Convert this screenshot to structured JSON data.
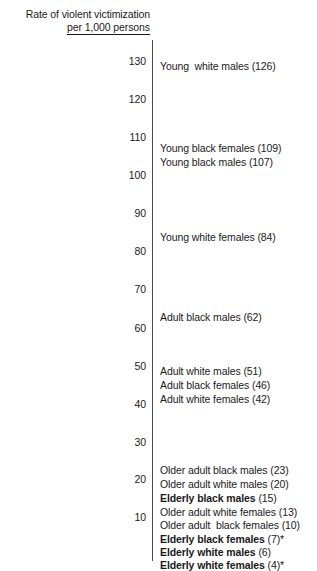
{
  "chart_data": {
    "type": "bar",
    "title": "Rate of violent victimization per 1,000 persons",
    "title_line1": "Rate of violent victimization",
    "title_line2": "per 1,000 persons",
    "xlabel": "",
    "ylabel": "Rate of violent victimization per 1,000 persons",
    "ylim": [
      0,
      135
    ],
    "grid": false,
    "legend": "none",
    "axis": "vertical-scale-with-annotations",
    "tick_labels": [
      "130",
      "120",
      "110",
      "100",
      "90",
      "80",
      "70",
      "60",
      "50",
      "40",
      "30",
      "20",
      "10"
    ],
    "ticks": [
      130,
      120,
      110,
      100,
      90,
      80,
      70,
      60,
      50,
      40,
      30,
      20,
      10
    ],
    "categories": [
      "Young  white males",
      "Young black females",
      "Young black males",
      "Young white females",
      "Adult black males",
      "Adult white males",
      "Adult black females",
      "Adult white females",
      "Older adult black males",
      "Older adult white males",
      "Elderly black males",
      "Older adult white females",
      "Older adult  black females",
      "Elderly black females",
      "Elderly white males",
      "Elderly white females"
    ],
    "values": [
      126,
      109,
      107,
      84,
      62,
      51,
      46,
      42,
      23,
      20,
      15,
      13,
      10,
      7,
      6,
      4
    ],
    "annotations": [
      {
        "name": "Young  white males",
        "value": "(126)",
        "bold": false,
        "y": 60
      },
      {
        "name": "Young black females",
        "value": "(109)",
        "bold": false,
        "y": 142
      },
      {
        "name": "Young black males",
        "value": "(107)",
        "bold": false,
        "y": 156
      },
      {
        "name": "Young white females",
        "value": "(84)",
        "bold": false,
        "y": 231
      },
      {
        "name": "Adult black males",
        "value": "(62)",
        "bold": false,
        "y": 311
      },
      {
        "name": "Adult white males",
        "value": "(51)",
        "bold": false,
        "y": 365
      },
      {
        "name": "Adult black females",
        "value": "(46)",
        "bold": false,
        "y": 379
      },
      {
        "name": "Adult white females",
        "value": "(42)",
        "bold": false,
        "y": 393
      },
      {
        "name": "Older adult black males",
        "value": "(23)",
        "bold": false,
        "y": 464
      },
      {
        "name": "Older adult white males",
        "value": "(20)",
        "bold": false,
        "y": 478
      },
      {
        "name": "Elderly black males",
        "value": "(15)",
        "bold": true,
        "y": 492
      },
      {
        "name": "Older adult white females",
        "value": "(13)",
        "bold": false,
        "y": 506
      },
      {
        "name": "Older adult  black females",
        "value": "(10)",
        "bold": false,
        "y": 519
      },
      {
        "name": "Elderly black females",
        "value": "(7)*",
        "bold": true,
        "y": 533
      },
      {
        "name": "Elderly white males",
        "value": "(6)",
        "bold": true,
        "y": 546
      },
      {
        "name": "Elderly white females",
        "value": "(4)*",
        "bold": true,
        "y": 559
      }
    ],
    "tick_positions": [
      {
        "label": "130",
        "y": 55
      },
      {
        "label": "120",
        "y": 93
      },
      {
        "label": "110",
        "y": 131
      },
      {
        "label": "100",
        "y": 169
      },
      {
        "label": "90",
        "y": 207
      },
      {
        "label": "80",
        "y": 245
      },
      {
        "label": "70",
        "y": 283
      },
      {
        "label": "60",
        "y": 322
      },
      {
        "label": "50",
        "y": 360
      },
      {
        "label": "40",
        "y": 398
      },
      {
        "label": "30",
        "y": 436
      },
      {
        "label": "20",
        "y": 473
      },
      {
        "label": "10",
        "y": 511
      }
    ],
    "colors": {
      "text": "#1a1a1a",
      "axis": "#4a4a4a",
      "background": "#ffffff"
    }
  }
}
